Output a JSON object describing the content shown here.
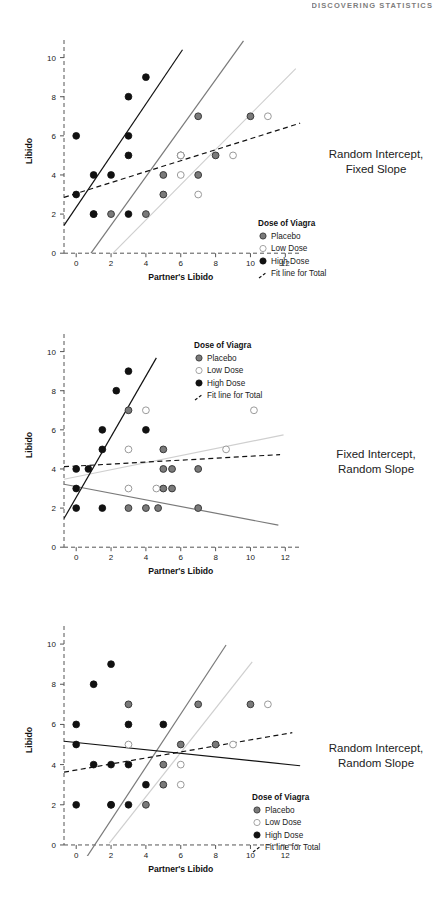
{
  "page": {
    "running_header": "DISCOVERING STATISTICS"
  },
  "axes": {
    "xlabel": "Partner's Libido",
    "ylabel": "Libido",
    "xticks": [
      "0",
      "2",
      "4",
      "6",
      "8",
      "10",
      "12"
    ],
    "yticks": [
      "0",
      "2",
      "4",
      "6",
      "8",
      "10"
    ],
    "xlim": [
      -0.7,
      12.9
    ],
    "ylim": [
      -0.45,
      10.9
    ]
  },
  "legend": {
    "title": "Dose of Viagra",
    "entries": [
      {
        "label": "Placebo",
        "marker": "filled-gray-circle",
        "color": "#7a7a7a"
      },
      {
        "label": "Low Dose",
        "marker": "open-circle",
        "color": "#cfcfcf"
      },
      {
        "label": "High Dose",
        "marker": "filled-black-circle",
        "color": "#111111"
      },
      {
        "label": "Fit line for Total",
        "marker": "dashed-line",
        "color": "#111111"
      }
    ]
  },
  "colors": {
    "placebo": "#7a7a7a",
    "low_dose": "#cfcfcf",
    "high_dose": "#111111",
    "total_fit": "#111111",
    "axis": "#555555"
  },
  "chart_data": [
    {
      "type": "scatter",
      "title": "Random Intercept, Fixed Slope",
      "xlabel": "Partner's Libido",
      "ylabel": "Libido",
      "xlim": [
        -0.7,
        12.9
      ],
      "ylim": [
        -0.45,
        10.9
      ],
      "grid": false,
      "legend_position": "bottom-right",
      "series": [
        {
          "name": "Placebo",
          "points": [
            [
              5,
              4
            ],
            [
              5,
              3
            ],
            [
              6,
              5
            ],
            [
              7,
              7
            ],
            [
              7,
              4
            ],
            [
              8,
              5
            ],
            [
              10,
              7
            ],
            [
              2,
              2
            ],
            [
              1,
              2
            ],
            [
              4,
              2
            ]
          ],
          "fit_line": {
            "intercept": -1.05,
            "slope": 1.24,
            "x_start": 0.85,
            "x_end": 9.6
          }
        },
        {
          "name": "Low Dose",
          "points": [
            [
              6,
              5
            ],
            [
              7,
              3
            ],
            [
              9,
              5
            ],
            [
              11,
              7
            ],
            [
              6,
              4
            ]
          ],
          "fit_line": {
            "intercept": -1.9,
            "slope": 0.9,
            "x_start": 2.1,
            "x_end": 12.6
          }
        },
        {
          "name": "High Dose",
          "points": [
            [
              0,
              6
            ],
            [
              0,
              3
            ],
            [
              1,
              4
            ],
            [
              2,
              4
            ],
            [
              3,
              6
            ],
            [
              3,
              5
            ],
            [
              3,
              8
            ],
            [
              4,
              9
            ],
            [
              1,
              2
            ],
            [
              3,
              2
            ]
          ],
          "fit_line": {
            "intercept": 2.35,
            "slope": 1.32,
            "x_start": -0.7,
            "x_end": 6.1
          }
        }
      ],
      "total_fit": {
        "intercept": 3.05,
        "slope": 0.28,
        "x_start": -0.7,
        "x_end": 12.85,
        "style": "dashed"
      }
    },
    {
      "type": "scatter",
      "title": "Fixed Intercept, Random Slope",
      "xlabel": "Partner's Libido",
      "ylabel": "Libido",
      "xlim": [
        -0.7,
        12.9
      ],
      "ylim": [
        -0.45,
        10.9
      ],
      "grid": false,
      "legend_position": "top-center",
      "series": [
        {
          "name": "Placebo",
          "points": [
            [
              3,
              7
            ],
            [
              5,
              5
            ],
            [
              5,
              4
            ],
            [
              5.5,
              4
            ],
            [
              7,
              4
            ],
            [
              3,
              2
            ],
            [
              4,
              2
            ],
            [
              4.7,
              2
            ],
            [
              7,
              2
            ],
            [
              5,
              3
            ],
            [
              5.5,
              3
            ]
          ],
          "fit_line": {
            "intercept": 3.1,
            "slope": -0.17,
            "x_start": -0.7,
            "x_end": 11.6
          }
        },
        {
          "name": "Low Dose",
          "points": [
            [
              4,
              7
            ],
            [
              10.2,
              7
            ],
            [
              3,
              5
            ],
            [
              8.6,
              5
            ],
            [
              3,
              3
            ],
            [
              4.6,
              3
            ]
          ],
          "fit_line": {
            "intercept": 3.6,
            "slope": 0.18,
            "x_start": -0.7,
            "x_end": 11.9
          }
        },
        {
          "name": "High Dose",
          "points": [
            [
              3,
              9
            ],
            [
              2.3,
              8
            ],
            [
              1.5,
              6
            ],
            [
              4,
              6
            ],
            [
              1.5,
              5
            ],
            [
              0,
              4
            ],
            [
              0.7,
              4
            ],
            [
              0,
              3
            ],
            [
              0,
              2
            ],
            [
              1.5,
              2
            ]
          ],
          "fit_line": {
            "intercept": 2.55,
            "slope": 1.55,
            "x_start": -0.7,
            "x_end": 4.6
          }
        }
      ],
      "total_fit": {
        "intercept": 4.15,
        "slope": 0.05,
        "x_start": -0.7,
        "x_end": 11.7,
        "style": "dashed"
      }
    },
    {
      "type": "scatter",
      "title": "Random Intercept, Random Slope",
      "xlabel": "Partner's Libido",
      "ylabel": "Libido",
      "xlim": [
        -0.7,
        12.9
      ],
      "ylim": [
        -0.45,
        10.9
      ],
      "grid": false,
      "legend_position": "bottom-right",
      "series": [
        {
          "name": "Placebo",
          "points": [
            [
              3,
              7
            ],
            [
              7,
              7
            ],
            [
              10,
              7
            ],
            [
              6,
              5
            ],
            [
              5,
              4
            ],
            [
              8,
              5
            ],
            [
              5,
              3
            ],
            [
              2,
              2
            ],
            [
              4,
              2
            ]
          ],
          "fit_line": {
            "intercept": -1.4,
            "slope": 1.32,
            "x_start": 0.55,
            "x_end": 8.6
          }
        },
        {
          "name": "Low Dose",
          "points": [
            [
              11,
              7
            ],
            [
              3,
              5
            ],
            [
              9,
              5
            ],
            [
              6,
              4
            ],
            [
              6,
              3
            ]
          ],
          "fit_line": {
            "intercept": -2.0,
            "slope": 1.1,
            "x_start": 1.9,
            "x_end": 10.1
          }
        },
        {
          "name": "High Dose",
          "points": [
            [
              2,
              9
            ],
            [
              1,
              8
            ],
            [
              0,
              6
            ],
            [
              3,
              6
            ],
            [
              5,
              6
            ],
            [
              0,
              5
            ],
            [
              1,
              4
            ],
            [
              2,
              4
            ],
            [
              3,
              4
            ],
            [
              4,
              3
            ],
            [
              0,
              2
            ],
            [
              2,
              2
            ],
            [
              3,
              2
            ]
          ],
          "fit_line": {
            "intercept": 5.1,
            "slope": -0.09,
            "x_start": -0.7,
            "x_end": 12.85
          }
        }
      ],
      "total_fit": {
        "intercept": 3.73,
        "slope": 0.15,
        "x_start": -0.7,
        "x_end": 12.4,
        "style": "dashed"
      }
    }
  ]
}
